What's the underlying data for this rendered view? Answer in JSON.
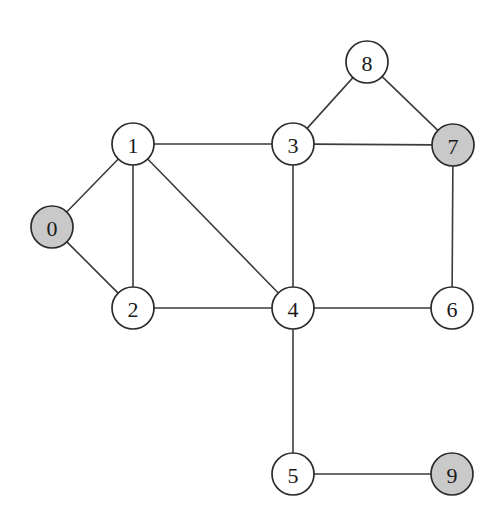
{
  "diagram": {
    "type": "undirected-graph",
    "title": "",
    "width": 501,
    "height": 525,
    "background_color": "#ffffff",
    "edge_color": "#3c3c3c",
    "node_border_color": "#2b2b2b",
    "node_fill_plain": "#ffffff",
    "node_fill_shaded": "#c9c9c9",
    "node_radius": 21,
    "nodes": [
      {
        "id": "0",
        "label": "0",
        "x": 52,
        "y": 227,
        "shaded": true
      },
      {
        "id": "1",
        "label": "1",
        "x": 133,
        "y": 144,
        "shaded": false
      },
      {
        "id": "2",
        "label": "2",
        "x": 133,
        "y": 308,
        "shaded": false
      },
      {
        "id": "3",
        "label": "3",
        "x": 293,
        "y": 144,
        "shaded": false
      },
      {
        "id": "4",
        "label": "4",
        "x": 293,
        "y": 308,
        "shaded": false
      },
      {
        "id": "5",
        "label": "5",
        "x": 293,
        "y": 474,
        "shaded": false
      },
      {
        "id": "6",
        "label": "6",
        "x": 452,
        "y": 308,
        "shaded": false
      },
      {
        "id": "7",
        "label": "7",
        "x": 453,
        "y": 145,
        "shaded": true
      },
      {
        "id": "8",
        "label": "8",
        "x": 367,
        "y": 62,
        "shaded": false
      },
      {
        "id": "9",
        "label": "9",
        "x": 452,
        "y": 474,
        "shaded": true
      }
    ],
    "edges": [
      {
        "source": "0",
        "target": "1"
      },
      {
        "source": "0",
        "target": "2"
      },
      {
        "source": "1",
        "target": "2"
      },
      {
        "source": "1",
        "target": "3"
      },
      {
        "source": "1",
        "target": "4"
      },
      {
        "source": "2",
        "target": "4"
      },
      {
        "source": "3",
        "target": "4"
      },
      {
        "source": "3",
        "target": "7"
      },
      {
        "source": "3",
        "target": "8"
      },
      {
        "source": "4",
        "target": "5"
      },
      {
        "source": "4",
        "target": "6"
      },
      {
        "source": "5",
        "target": "9"
      },
      {
        "source": "6",
        "target": "7"
      },
      {
        "source": "7",
        "target": "8"
      }
    ],
    "shaded_nodes": [
      "0",
      "7",
      "9"
    ],
    "node_count": 10,
    "edge_count": 14
  }
}
